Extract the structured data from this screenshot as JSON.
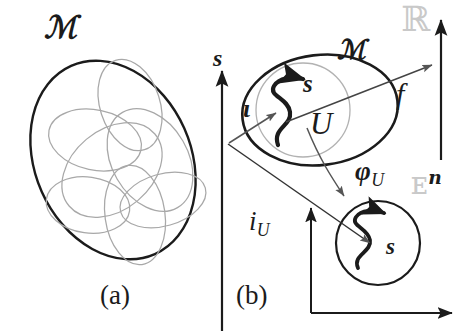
{
  "figure": {
    "background_color": "#ffffff",
    "ink_color": "#1b1b1b",
    "patch_color": "#a0a0a0",
    "blackboard_color": "#c9c9c9",
    "width": 470,
    "height": 331
  },
  "panel_a": {
    "caption": "(a)",
    "manifold_label": "ℳ",
    "description": "tilted ellipse manifold covered by overlapping coordinate patches",
    "patch_count": 6
  },
  "panel_b": {
    "caption": "(b)",
    "manifold_label": "ℳ",
    "neighborhood_label": "U",
    "section_label": "s",
    "inclusion_label": "ι",
    "chart_label": "φ",
    "chart_subscript": "U",
    "chart_full_label": "φU",
    "bundle_map_label": "f",
    "induced_label": "i",
    "induced_subscript": "U",
    "induced_full_label": "iU",
    "axis_label": "s",
    "codomain_label": "ℝ",
    "euclidean_label": "ᴇ",
    "euclidean_superscript": "n",
    "euclidean_full_label": "ᴇn",
    "local_section_label": "s"
  }
}
